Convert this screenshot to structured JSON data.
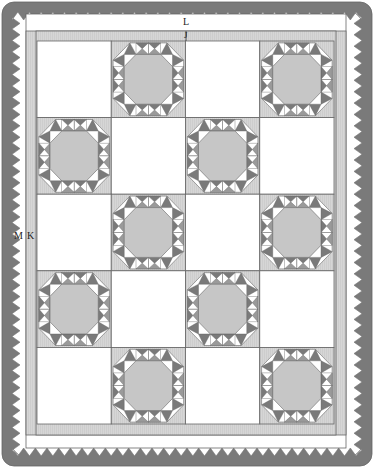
{
  "diagram": {
    "labels": {
      "L": "L",
      "J": "J",
      "M": "M",
      "K": "K"
    },
    "grid": {
      "columns": 4,
      "rows": 5,
      "layout": [
        [
          "plain",
          "star",
          "plain",
          "star"
        ],
        [
          "star",
          "plain",
          "star",
          "plain"
        ],
        [
          "plain",
          "star",
          "plain",
          "star"
        ],
        [
          "star",
          "plain",
          "star",
          "plain"
        ],
        [
          "plain",
          "star",
          "plain",
          "star"
        ]
      ]
    },
    "borders": [
      {
        "id": "J",
        "description": "inner border strip"
      },
      {
        "id": "K",
        "description": "second border strip"
      },
      {
        "id": "L",
        "description": "wide white border"
      },
      {
        "id": "M",
        "description": "outer sawtooth (prairie point) border"
      }
    ],
    "colors": {
      "background": "#ffffff",
      "light_gray": "#d4d4d4",
      "mid_gray": "#c6c6c6",
      "dark_gray": "#7a7a7a",
      "line": "#555555",
      "white": "#ffffff"
    }
  }
}
